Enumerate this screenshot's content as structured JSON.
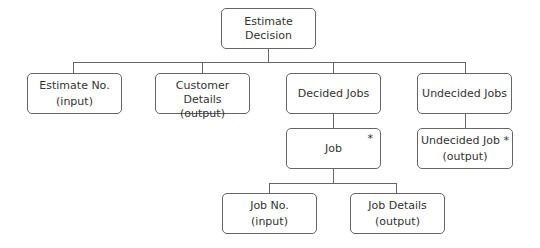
{
  "diagram": {
    "type": "jackson-structure-chart",
    "root": {
      "line1": "Estimate",
      "line2": "Decision"
    },
    "children": [
      {
        "title": "Estimate No.",
        "annotation": "(input)"
      },
      {
        "title": "Customer Details",
        "annotation": "(output)"
      },
      {
        "title": "Decided Jobs"
      },
      {
        "title": "Undecided Jobs"
      }
    ],
    "job": {
      "title": "Job",
      "iteration_marker": "*"
    },
    "undecided_job": {
      "title": "Undecided Job *",
      "annotation": "(output)"
    },
    "job_children": [
      {
        "title": "Job No.",
        "annotation": "(input)"
      },
      {
        "title": "Job Details",
        "annotation": "(output)"
      }
    ],
    "colors": {
      "line": "#666666",
      "text": "#333333",
      "background": "#ffffff"
    }
  }
}
